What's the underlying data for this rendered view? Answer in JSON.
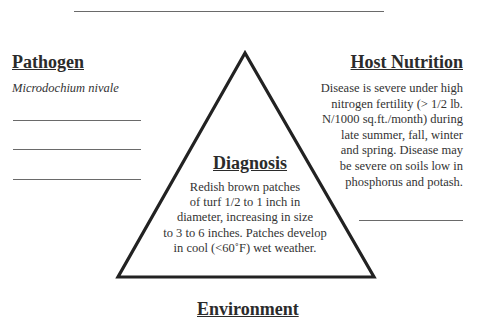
{
  "diagram": {
    "type": "disease-triangle",
    "pathogen": {
      "heading": "Pathogen",
      "name": "Microdochium nivale",
      "blank_lines": 3
    },
    "host_nutrition": {
      "heading": "Host Nutrition",
      "lines": [
        "Disease is severe under high",
        "nitrogen fertility (> 1/2 lb.",
        "N/1000 sq.ft./month) during",
        "late summer, fall, winter",
        "and spring.  Disease may",
        "be severe on soils low in",
        "phosphorus and potash."
      ],
      "blank_lines": 1
    },
    "diagnosis": {
      "heading": "Diagnosis",
      "lines": [
        "Redish brown patches",
        "of turf 1/2 to 1 inch in",
        "diameter, increasing in size",
        "to 3 to 6 inches.  Patches develop",
        "in cool (<60˚F) wet weather."
      ]
    },
    "environment": {
      "heading": "Environment"
    },
    "colors": {
      "triangle_stroke": "#222222",
      "rule": "#6a6a6a",
      "text": "#333333"
    }
  }
}
